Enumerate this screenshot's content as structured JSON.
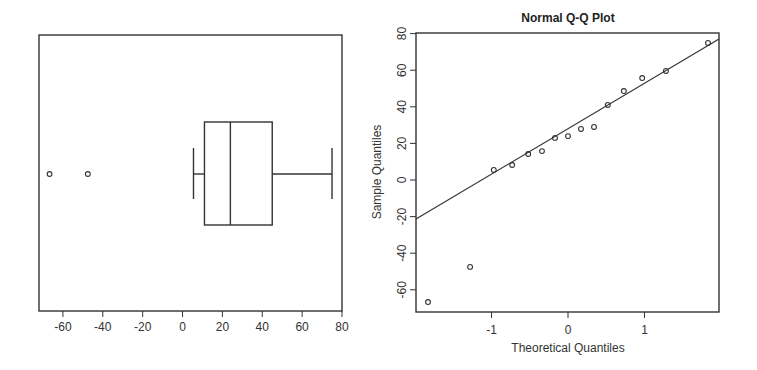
{
  "chart_data": [
    {
      "type": "boxplot",
      "orientation": "horizontal",
      "title": "",
      "xlabel": "",
      "ylabel": "",
      "xlim": [
        -72,
        80
      ],
      "xticks": [
        -60,
        -40,
        -20,
        0,
        20,
        40,
        60,
        80
      ],
      "xtick_labels": [
        "-60",
        "-40",
        "-20",
        "0",
        "20",
        "40",
        "60",
        "80"
      ],
      "stats": {
        "lower_whisker": 5.5,
        "q1": 11,
        "median": 24,
        "q3": 45,
        "upper_whisker": 75
      },
      "outliers": [
        -66.7,
        -47.5
      ],
      "grid": false
    },
    {
      "type": "scatter",
      "subtype": "normal-qq",
      "title": "Normal Q-Q Plot",
      "xlabel": "Theoretical Quantiles",
      "ylabel": "Sample Quantiles",
      "xlim": [
        -1.98,
        1.98
      ],
      "ylim": [
        -72,
        80
      ],
      "xticks": [
        -1,
        0,
        1
      ],
      "xtick_labels": [
        "-1",
        "0",
        "1"
      ],
      "yticks": [
        -60,
        -40,
        -20,
        0,
        20,
        40,
        60,
        80
      ],
      "ytick_labels": [
        "-60",
        "-40",
        "-20",
        "0",
        "20",
        "40",
        "60",
        "80"
      ],
      "x": [
        -1.83,
        -1.28,
        -0.97,
        -0.73,
        -0.52,
        -0.34,
        -0.17,
        0.0,
        0.17,
        0.34,
        0.52,
        0.73,
        0.97,
        1.28,
        1.83
      ],
      "y": [
        -66.7,
        -47.5,
        5.5,
        8.2,
        14.2,
        15.8,
        23,
        24,
        27.9,
        29,
        41,
        48.6,
        55.7,
        59.6,
        74.9
      ],
      "reference_line": {
        "x1": -1.98,
        "y1": -21,
        "x2": 1.98,
        "y2": 77
      },
      "grid": false
    }
  ]
}
